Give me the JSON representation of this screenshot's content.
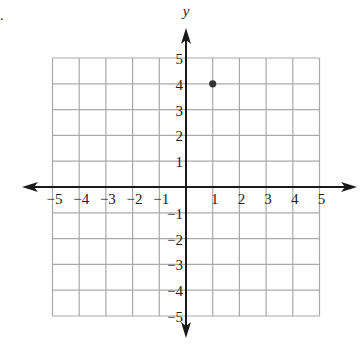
{
  "problem": {
    "marker": "."
  },
  "chart_data": {
    "type": "scatter",
    "title": "",
    "xlabel": "x",
    "ylabel": "y",
    "xlim": [
      -5,
      5
    ],
    "ylim": [
      -5,
      5
    ],
    "grid": true,
    "x_ticks": [
      "-5",
      "-4",
      "-3",
      "-2",
      "-1",
      "1",
      "2",
      "3",
      "4",
      "5"
    ],
    "y_ticks": [
      "5",
      "4",
      "3",
      "2",
      "1",
      "-1",
      "-2",
      "-3",
      "-4",
      "-5"
    ],
    "points": [
      {
        "x": 1,
        "y": 4
      }
    ],
    "colors": {
      "grid": "#a9a9a9",
      "axis": "#1a1a1a",
      "point": "#333333",
      "text": "#222222"
    }
  }
}
